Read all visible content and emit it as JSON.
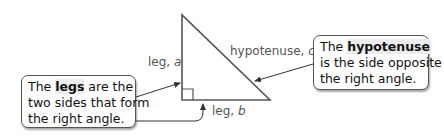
{
  "diagram": {
    "triangle": {
      "stroke_color": "#555555",
      "labels": {
        "leg_a": {
          "prefix": "leg, ",
          "var": "a"
        },
        "leg_b": {
          "prefix": "leg, ",
          "var": "b"
        },
        "hypotenuse": {
          "prefix": "hypotenuse, ",
          "var": "c"
        }
      }
    },
    "callouts": {
      "legs": {
        "pre": "The ",
        "term": "legs",
        "post": " are the",
        "line2": "two sides that form",
        "line3": "the right angle."
      },
      "hypotenuse": {
        "pre": "The ",
        "term": "hypotenuse",
        "post": "",
        "line2": "is the side opposite",
        "line3": "the right angle."
      }
    }
  }
}
